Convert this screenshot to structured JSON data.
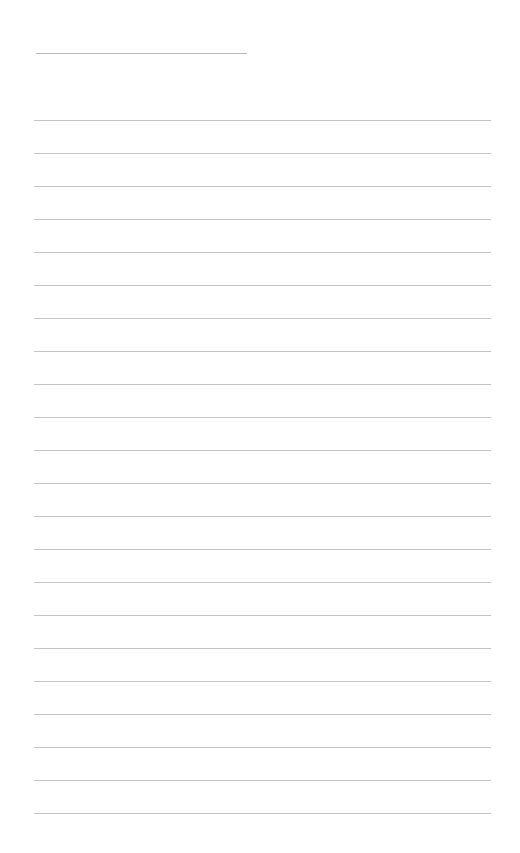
{
  "page": {
    "type": "blank ruled writing sheet",
    "title_line": {
      "text": ""
    },
    "rules": {
      "count": 22,
      "first_top": 120,
      "spacing": 33,
      "entries": [
        "",
        "",
        "",
        "",
        "",
        "",
        "",
        "",
        "",
        "",
        "",
        "",
        "",
        "",
        "",
        "",
        "",
        "",
        "",
        "",
        "",
        ""
      ]
    },
    "colors": {
      "background": "#ffffff",
      "rule": "#c4c4c4",
      "title_rule": "#b8b8b8"
    }
  }
}
